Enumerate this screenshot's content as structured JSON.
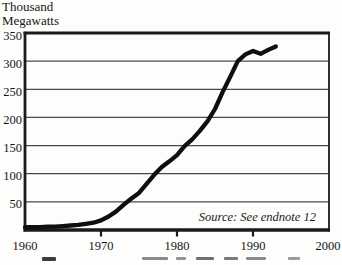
{
  "page": {
    "background": "#fdfdfc"
  },
  "chart_data": {
    "type": "line",
    "title": "",
    "ylabel_lines": [
      "Thousand",
      "Megawatts"
    ],
    "xlabel": "",
    "x": [
      1960,
      1961,
      1962,
      1963,
      1964,
      1965,
      1966,
      1967,
      1968,
      1969,
      1970,
      1971,
      1972,
      1973,
      1974,
      1975,
      1976,
      1977,
      1978,
      1979,
      1980,
      1981,
      1982,
      1983,
      1984,
      1985,
      1986,
      1987,
      1988,
      1989,
      1990,
      1991,
      1992,
      1993
    ],
    "values": [
      5,
      5,
      5,
      6,
      6,
      7,
      8,
      9,
      11,
      13,
      17,
      24,
      33,
      45,
      56,
      66,
      82,
      98,
      112,
      122,
      133,
      149,
      161,
      176,
      193,
      215,
      245,
      272,
      300,
      312,
      318,
      313,
      320,
      326
    ],
    "x_ticks": [
      1960,
      1970,
      1980,
      1990,
      2000
    ],
    "y_ticks": [
      50,
      100,
      150,
      200,
      250,
      300,
      350
    ],
    "xlim": [
      1960,
      2000
    ],
    "ylim": [
      0,
      350
    ],
    "grid": "horizontal",
    "legend": "none",
    "line_color": "#0f0f0f",
    "grid_color": "#4a4a4a",
    "frame_color": "#1a1a1a",
    "source_note": "Source: See endnote 12"
  }
}
